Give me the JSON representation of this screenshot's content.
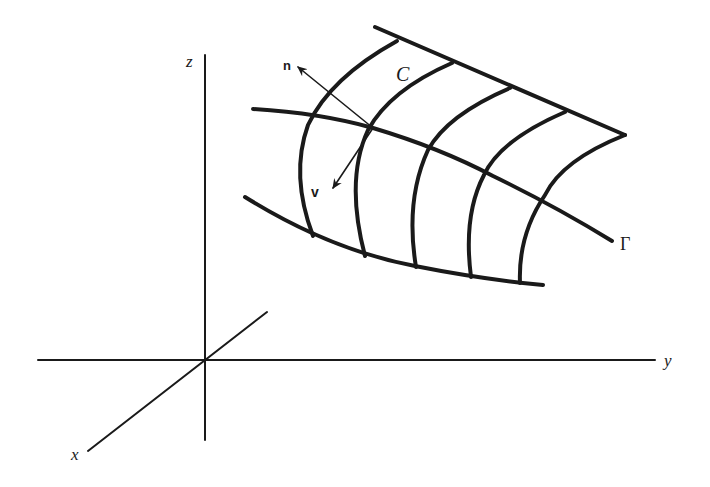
{
  "diagram": {
    "type": "surface-in-3d-axes",
    "colors": {
      "ink": "#1a1a1a",
      "background": "#ffffff"
    },
    "axes": {
      "x_label": "x",
      "y_label": "y",
      "z_label": "z"
    },
    "labels": {
      "curve_c": "C",
      "curve_gamma": "Γ",
      "normal_vector": "n",
      "vector_v": "v"
    }
  }
}
